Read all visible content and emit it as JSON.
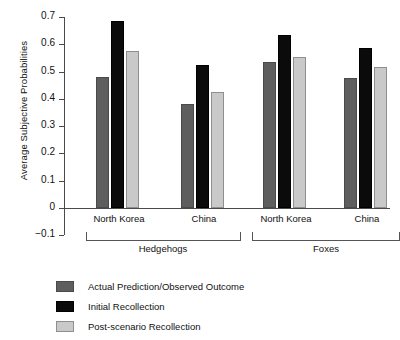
{
  "chart_data": {
    "type": "bar",
    "title": "",
    "xlabel": "",
    "ylabel": "Average Subjective Probabilities",
    "ylim": [
      -0.1,
      0.7
    ],
    "yticks": [
      0.7,
      0.6,
      0.5,
      0.4,
      0.3,
      0.2,
      0.1,
      0,
      -0.1
    ],
    "ytick_labels": [
      "0.7",
      "0.6",
      "0.5",
      "0.4",
      "0.3",
      "0.2",
      "0.1",
      "0",
      "−0.1"
    ],
    "grid": false,
    "legend_position": "below-left",
    "categories": [
      "North Korea",
      "China",
      "North Korea",
      "China"
    ],
    "groups": [
      {
        "label": "Hedgehogs",
        "categories": [
          "North Korea",
          "China"
        ]
      },
      {
        "label": "Foxes",
        "categories": [
          "North Korea",
          "China"
        ]
      }
    ],
    "series": [
      {
        "name": "Actual Prediction/Observed Outcome",
        "color": "#5e5e5e",
        "values": [
          0.48,
          0.38,
          0.535,
          0.475
        ]
      },
      {
        "name": "Initial Recollection",
        "color": "#0b0b0b",
        "values": [
          0.685,
          0.525,
          0.635,
          0.585
        ]
      },
      {
        "name": "Post-scenario Recollection",
        "color": "#c9c9c9",
        "values": [
          0.575,
          0.425,
          0.555,
          0.515
        ]
      }
    ]
  }
}
